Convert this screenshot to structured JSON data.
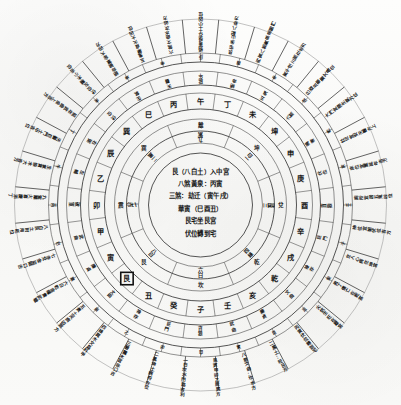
{
  "figure": {
    "type": "feng-shui-luopan",
    "background_color": "#fbfbfa",
    "ink_color": "#1a1a1a",
    "width": 401,
    "height": 405
  },
  "center_panel": {
    "lines": [
      "艮（八白土）入中宮",
      "八煞黃泉：丙寅",
      "三煞：劫迁（寅午戌）",
      "華寅（巳酉丑）",
      "艮宅坐艮宮",
      "伏位轉到宅"
    ]
  },
  "rings": {
    "inner_trigram": {
      "name": "八卦宮位環",
      "count": 8,
      "labels": [
        "離",
        "坤",
        "兌",
        "乾",
        "坎",
        "艮",
        "震",
        "巽"
      ]
    },
    "flying_star": {
      "name": "飛星環",
      "count": 8,
      "labels": [
        "九紫",
        "一白",
        "三碧",
        "四綠",
        "六白",
        "八白",
        "七赤",
        "二黑"
      ]
    },
    "twenty_four_mountains": {
      "name": "二十四山環",
      "count": 24,
      "labels": [
        "子",
        "癸",
        "丑",
        "艮",
        "寅",
        "甲",
        "卯",
        "乙",
        "辰",
        "巽",
        "巳",
        "丙",
        "午",
        "丁",
        "未",
        "坤",
        "申",
        "庚",
        "酉",
        "辛",
        "戌",
        "乾",
        "亥",
        "壬"
      ],
      "highlighted": "艮"
    },
    "auxiliary": {
      "name": "輔星環",
      "count": 24,
      "labels": [
        "貪狼",
        "巨門",
        "祿存",
        "文曲",
        "廉貞",
        "武曲",
        "破軍",
        "左輔",
        "右弼",
        "伏位",
        "生氣",
        "天醫",
        "延年",
        "絕命",
        "五鬼",
        "六煞",
        "禍害",
        "伏位",
        "貪狼",
        "巨門",
        "祿存",
        "文曲",
        "廉貞",
        "武曲"
      ]
    },
    "degree_ring": {
      "name": "分金環",
      "count": 48
    }
  },
  "radial_annotations": [
    "一白坎水門路吉利",
    "二黑坤土病符方位",
    "三碧震木官非口舌",
    "四綠巽木文昌科甲",
    "五黃土災病凶煞方",
    "六白乾金權貴武職",
    "七赤兌金盜賊口舌",
    "八白艮土財帛旺位",
    "九紫離火喜慶添丁",
    "生氣貪狼木大吉方",
    "天醫巨門土中吉位",
    "延年武曲金上吉方",
    "伏位左輔木小吉位",
    "絕命破軍金大凶方",
    "五鬼廉貞火大凶位",
    "六煞文曲水次凶方",
    "禍害祿存土小凶位",
    "艮宅坐山配八卦方",
    "丙寅八煞黃泉忌開門",
    "寅午戌三煞在北方",
    "巳酉丑華蓋文昌位",
    "大門宜開生氣方位",
    "灶位宜安天醫方上",
    "床位宜置延年吉方",
    "廁所宜居五鬼凶位",
    "神位宜朝伏位吉方",
    "女人心病在坤宮",
    "男丁傷亡在乾宮",
    "火炕生旺在離宮",
    "丙寅伏位轉到宅",
    "二黑土：旺艮方",
    "八煞文曲：坎水方",
    "艮寅甲卯乙辰巽方"
  ],
  "rim_annotations": [
    "甲",
    "卯",
    "乙",
    "辰",
    "巽",
    "巳",
    "丙",
    "午",
    "丁",
    "未",
    "坤",
    "申",
    "庚",
    "酉",
    "辛",
    "戌",
    "乾",
    "亥",
    "壬",
    "子",
    "癸",
    "丑",
    "艮",
    "寅"
  ]
}
